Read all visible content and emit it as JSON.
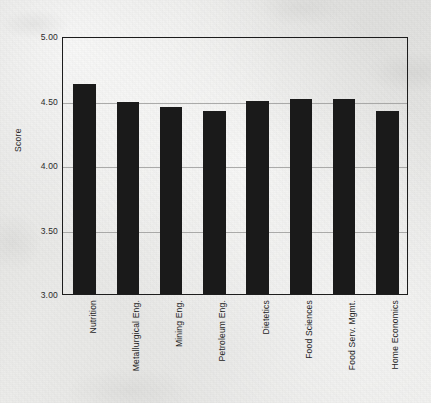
{
  "chart_data": {
    "type": "bar",
    "title": "",
    "subtitle": "",
    "xlabel": "",
    "ylabel": "Score",
    "ylim": [
      3.0,
      5.0
    ],
    "yticks": [
      "3.00",
      "3.50",
      "4.00",
      "4.50",
      "5.00"
    ],
    "ytick_values": [
      3.0,
      3.5,
      4.0,
      4.5,
      5.0
    ],
    "grid": true,
    "legend": "none",
    "bar_color": "#1a1a1a",
    "categories": [
      "Nutrition",
      "Metallurgical  Eng.",
      "Mining Eng.",
      "Petroleum Eng.",
      "Dietetics",
      "Food Sciences",
      "Food Serv. Mgmt.",
      "Home Economics"
    ],
    "values": [
      4.63,
      4.49,
      4.45,
      4.42,
      4.5,
      4.51,
      4.51,
      4.42
    ]
  },
  "colors": {
    "paper": "#e8e8e6",
    "ink": "#1a1a1a",
    "grid": "#9e9e9c",
    "frame": "#1c1c1c"
  }
}
